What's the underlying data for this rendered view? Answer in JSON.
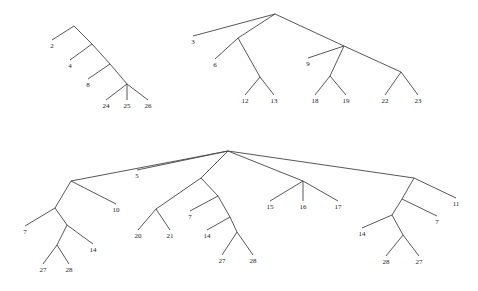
{
  "trees": [
    {
      "id": "tree-1",
      "nodes": [
        {
          "id": "r",
          "x": 74,
          "y": 26
        },
        {
          "id": "a",
          "x": 92,
          "y": 44
        },
        {
          "id": "b",
          "x": 110,
          "y": 64
        },
        {
          "id": "c",
          "x": 127,
          "y": 84
        },
        {
          "id": "l2",
          "x": 52,
          "y": 48,
          "label": "2"
        },
        {
          "id": "l4",
          "x": 70,
          "y": 68,
          "label": "4"
        },
        {
          "id": "l8",
          "x": 88,
          "y": 87,
          "label": "8"
        },
        {
          "id": "l24",
          "x": 106,
          "y": 108,
          "label": "24"
        },
        {
          "id": "l25",
          "x": 127,
          "y": 108,
          "label": "25"
        },
        {
          "id": "l26",
          "x": 148,
          "y": 108,
          "label": "26"
        }
      ],
      "edges": [
        [
          "r",
          "l2"
        ],
        [
          "r",
          "a"
        ],
        [
          "a",
          "l4"
        ],
        [
          "a",
          "b"
        ],
        [
          "b",
          "l8"
        ],
        [
          "b",
          "c"
        ],
        [
          "c",
          "l24"
        ],
        [
          "c",
          "l25"
        ],
        [
          "c",
          "l26"
        ]
      ]
    },
    {
      "id": "tree-2",
      "nodes": [
        {
          "id": "r",
          "x": 275,
          "y": 14
        },
        {
          "id": "a",
          "x": 238,
          "y": 38
        },
        {
          "id": "b",
          "x": 260,
          "y": 77
        },
        {
          "id": "c",
          "x": 344,
          "y": 46
        },
        {
          "id": "d",
          "x": 330,
          "y": 76
        },
        {
          "id": "e",
          "x": 401,
          "y": 72
        },
        {
          "id": "l3",
          "x": 193,
          "y": 44,
          "label": "3"
        },
        {
          "id": "l6",
          "x": 215,
          "y": 67,
          "label": "6"
        },
        {
          "id": "l12",
          "x": 245,
          "y": 103,
          "label": "12"
        },
        {
          "id": "l13",
          "x": 274,
          "y": 103,
          "label": "13"
        },
        {
          "id": "l9",
          "x": 308,
          "y": 66,
          "label": "9"
        },
        {
          "id": "l18",
          "x": 315,
          "y": 103,
          "label": "18"
        },
        {
          "id": "l19",
          "x": 346,
          "y": 103,
          "label": "19"
        },
        {
          "id": "l22",
          "x": 385,
          "y": 103,
          "label": "22"
        },
        {
          "id": "l23",
          "x": 418,
          "y": 103,
          "label": "23"
        }
      ],
      "edges": [
        [
          "r",
          "l3"
        ],
        [
          "r",
          "a"
        ],
        [
          "r",
          "c"
        ],
        [
          "a",
          "l6"
        ],
        [
          "a",
          "b"
        ],
        [
          "b",
          "l12"
        ],
        [
          "b",
          "l13"
        ],
        [
          "c",
          "l9"
        ],
        [
          "c",
          "d"
        ],
        [
          "c",
          "e"
        ],
        [
          "d",
          "l18"
        ],
        [
          "d",
          "l19"
        ],
        [
          "e",
          "l22"
        ],
        [
          "e",
          "l23"
        ]
      ]
    },
    {
      "id": "tree-3",
      "nodes": [
        {
          "id": "r",
          "x": 228,
          "y": 151
        },
        {
          "id": "a",
          "x": 71,
          "y": 181
        },
        {
          "id": "a1",
          "x": 55,
          "y": 208
        },
        {
          "id": "a2",
          "x": 67,
          "y": 225
        },
        {
          "id": "a3",
          "x": 57,
          "y": 245
        },
        {
          "id": "b",
          "x": 201,
          "y": 178
        },
        {
          "id": "b1",
          "x": 156,
          "y": 209
        },
        {
          "id": "b2",
          "x": 218,
          "y": 196
        },
        {
          "id": "b3",
          "x": 230,
          "y": 217
        },
        {
          "id": "b4",
          "x": 237,
          "y": 232
        },
        {
          "id": "c",
          "x": 303,
          "y": 181
        },
        {
          "id": "d",
          "x": 414,
          "y": 178
        },
        {
          "id": "d1",
          "x": 402,
          "y": 199
        },
        {
          "id": "d2",
          "x": 392,
          "y": 215
        },
        {
          "id": "d3",
          "x": 403,
          "y": 235
        },
        {
          "id": "l5",
          "x": 137,
          "y": 178,
          "label": "5"
        },
        {
          "id": "l7a",
          "x": 25,
          "y": 234,
          "label": "7"
        },
        {
          "id": "l10",
          "x": 116,
          "y": 212,
          "label": "10"
        },
        {
          "id": "l14a",
          "x": 93,
          "y": 252,
          "label": "14"
        },
        {
          "id": "l27a",
          "x": 43,
          "y": 272,
          "label": "27"
        },
        {
          "id": "l28a",
          "x": 69,
          "y": 272,
          "label": "28"
        },
        {
          "id": "l20",
          "x": 138,
          "y": 238,
          "label": "20"
        },
        {
          "id": "l21",
          "x": 170,
          "y": 238,
          "label": "21"
        },
        {
          "id": "l7b",
          "x": 190,
          "y": 219,
          "label": "7"
        },
        {
          "id": "l14b",
          "x": 207,
          "y": 238,
          "label": "14"
        },
        {
          "id": "l27b",
          "x": 222,
          "y": 263,
          "label": "27"
        },
        {
          "id": "l28b",
          "x": 253,
          "y": 263,
          "label": "28"
        },
        {
          "id": "l15",
          "x": 270,
          "y": 209,
          "label": "15"
        },
        {
          "id": "l16",
          "x": 303,
          "y": 209,
          "label": "16"
        },
        {
          "id": "l17",
          "x": 338,
          "y": 209,
          "label": "17"
        },
        {
          "id": "l11",
          "x": 456,
          "y": 206,
          "label": "11"
        },
        {
          "id": "l7c",
          "x": 437,
          "y": 224,
          "label": "7"
        },
        {
          "id": "l14c",
          "x": 362,
          "y": 236,
          "label": "14"
        },
        {
          "id": "l28c",
          "x": 386,
          "y": 264,
          "label": "28"
        },
        {
          "id": "l27c",
          "x": 419,
          "y": 264,
          "label": "27"
        }
      ],
      "edges": [
        [
          "r",
          "a"
        ],
        [
          "r",
          "l5"
        ],
        [
          "r",
          "b"
        ],
        [
          "r",
          "c"
        ],
        [
          "r",
          "d"
        ],
        [
          "a",
          "a1"
        ],
        [
          "a",
          "l10"
        ],
        [
          "a1",
          "l7a"
        ],
        [
          "a1",
          "a2"
        ],
        [
          "a2",
          "a3"
        ],
        [
          "a2",
          "l14a"
        ],
        [
          "a3",
          "l27a"
        ],
        [
          "a3",
          "l28a"
        ],
        [
          "b",
          "b1"
        ],
        [
          "b",
          "b2"
        ],
        [
          "b1",
          "l20"
        ],
        [
          "b1",
          "l21"
        ],
        [
          "b2",
          "l7b"
        ],
        [
          "b2",
          "b3"
        ],
        [
          "b3",
          "l14b"
        ],
        [
          "b3",
          "b4"
        ],
        [
          "b4",
          "l27b"
        ],
        [
          "b4",
          "l28b"
        ],
        [
          "c",
          "l15"
        ],
        [
          "c",
          "l16"
        ],
        [
          "c",
          "l17"
        ],
        [
          "d",
          "d1"
        ],
        [
          "d",
          "l11"
        ],
        [
          "d1",
          "d2"
        ],
        [
          "d1",
          "l7c"
        ],
        [
          "d2",
          "l14c"
        ],
        [
          "d2",
          "d3"
        ],
        [
          "d3",
          "l28c"
        ],
        [
          "d3",
          "l27c"
        ]
      ]
    }
  ]
}
